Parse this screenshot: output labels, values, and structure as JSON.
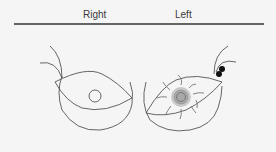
{
  "diagram": {
    "labels": {
      "right": "Right",
      "left": "Left"
    },
    "colors": {
      "background": "#f5f5f5",
      "outline": "#4a4a4a",
      "header_rule": "#333333",
      "lesion": "#9a9a9a",
      "lymph_nodes": "#111111"
    },
    "elements": {
      "right_breast": {
        "nipple": "normal circle"
      },
      "left_breast": {
        "lesion": "central mass with radiating lines",
        "axillary_nodes": 2
      }
    }
  }
}
